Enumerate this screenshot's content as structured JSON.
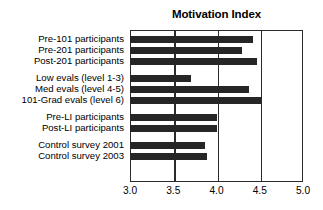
{
  "chart_data": {
    "type": "bar",
    "orientation": "horizontal",
    "title": "Motivation Index",
    "xlabel": "",
    "ylabel": "",
    "xlim": [
      3.0,
      5.0
    ],
    "xticks": [
      "3.0",
      "3.5",
      "4.0",
      "4.5",
      "5.0"
    ],
    "xtick_values": [
      3.0,
      3.5,
      4.0,
      4.5,
      5.0
    ],
    "grid": true,
    "grid_axis": "x",
    "legend": false,
    "bar_color": "#262626",
    "categories": [
      "Pre-101 participants",
      "Pre-201 participants",
      "Post-201 participants",
      "Low evals (level 1-3)",
      "Med evals (level 4-5)",
      "101-Grad evals (level 6)",
      "Pre-LI participants",
      "Post-LI participants",
      "Control survey 2001",
      "Control survey 2003"
    ],
    "values": [
      4.42,
      4.3,
      4.47,
      3.7,
      4.38,
      4.52,
      4.0,
      4.0,
      3.87,
      3.89
    ],
    "groups": [
      {
        "name": "course participants",
        "indices": [
          0,
          1,
          2
        ]
      },
      {
        "name": "evaluation levels",
        "indices": [
          3,
          4,
          5
        ]
      },
      {
        "name": "LI participants",
        "indices": [
          6,
          7
        ]
      },
      {
        "name": "control surveys",
        "indices": [
          8,
          9
        ]
      }
    ]
  },
  "axis": {
    "tick_0": "3.0",
    "tick_1": "3.5",
    "tick_2": "4.0",
    "tick_3": "4.5",
    "tick_4": "5.0"
  },
  "labels": {
    "row_0": "Pre-101 participants",
    "row_1": "Pre-201 participants",
    "row_2": "Post-201 participants",
    "row_3": "Low evals (level 1-3)",
    "row_4": "Med evals (level 4-5)",
    "row_5": "101-Grad evals (level 6)",
    "row_6": "Pre-LI participants",
    "row_7": "Post-LI participants",
    "row_8": "Control survey 2001",
    "row_9": "Control survey 2003"
  },
  "artifact": {
    "top_cropped_text": ""
  }
}
